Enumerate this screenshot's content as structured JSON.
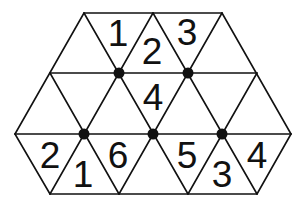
{
  "diagram": {
    "type": "triangular-grid-number-puzzle",
    "shape": "hexagon",
    "colors": {
      "line": "#111111",
      "background": "#ffffff",
      "dot": "#111111"
    },
    "vertices": {
      "rows_y": [
        13,
        73,
        134,
        194
      ],
      "row0_x": [
        84,
        153,
        222
      ],
      "row1_x": [
        50,
        119,
        188,
        257
      ],
      "row2_x": [
        15,
        84,
        153,
        222,
        291
      ],
      "row3_x": [
        50,
        119,
        188,
        257
      ]
    },
    "dots": [
      {
        "x": 119,
        "y": 73
      },
      {
        "x": 188,
        "y": 73
      },
      {
        "x": 84,
        "y": 134
      },
      {
        "x": 153,
        "y": 134
      },
      {
        "x": 222,
        "y": 134
      }
    ],
    "numbers": [
      {
        "value": "1",
        "x": 118,
        "y": 33
      },
      {
        "value": "2",
        "x": 152,
        "y": 51
      },
      {
        "value": "3",
        "x": 187,
        "y": 32
      },
      {
        "value": "4",
        "x": 153,
        "y": 97
      },
      {
        "value": "2",
        "x": 50,
        "y": 155
      },
      {
        "value": "1",
        "x": 83,
        "y": 174
      },
      {
        "value": "6",
        "x": 118,
        "y": 155
      },
      {
        "value": "5",
        "x": 187,
        "y": 155
      },
      {
        "value": "3",
        "x": 222,
        "y": 174
      },
      {
        "value": "4",
        "x": 257,
        "y": 155
      }
    ]
  }
}
